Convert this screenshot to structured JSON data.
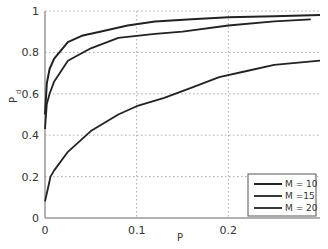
{
  "chart_data": {
    "type": "line",
    "title": "",
    "xlabel": "P",
    "ylabel": "P_d",
    "ylabel_main": "P",
    "ylabel_sub": "d",
    "xlim": [
      0,
      0.3
    ],
    "ylim": [
      0,
      1
    ],
    "grid": true,
    "legend_position": "lower right",
    "x_ticks": [
      "0",
      "0.1",
      "0.2"
    ],
    "y_ticks": [
      "0",
      "0.2",
      "0.4",
      "0.6",
      "0.8",
      "1"
    ],
    "series": [
      {
        "name": "M = 10",
        "x": [
          0,
          0.002,
          0.005,
          0.01,
          0.025,
          0.04,
          0.06,
          0.09,
          0.12,
          0.16,
          0.2,
          0.25,
          0.3
        ],
        "values": [
          0.5,
          0.65,
          0.72,
          0.77,
          0.85,
          0.88,
          0.9,
          0.93,
          0.95,
          0.96,
          0.97,
          0.975,
          0.98
        ]
      },
      {
        "name": "M =15",
        "x": [
          0,
          0.002,
          0.005,
          0.01,
          0.025,
          0.05,
          0.08,
          0.12,
          0.15,
          0.2,
          0.25,
          0.29
        ],
        "values": [
          0.43,
          0.55,
          0.6,
          0.66,
          0.76,
          0.82,
          0.87,
          0.89,
          0.9,
          0.93,
          0.95,
          0.96
        ]
      },
      {
        "name": "M = 20",
        "x": [
          0,
          0.003,
          0.006,
          0.01,
          0.025,
          0.05,
          0.08,
          0.1,
          0.13,
          0.16,
          0.19,
          0.22,
          0.25,
          0.3
        ],
        "values": [
          0.08,
          0.14,
          0.2,
          0.23,
          0.32,
          0.42,
          0.5,
          0.54,
          0.58,
          0.63,
          0.68,
          0.71,
          0.74,
          0.76
        ]
      }
    ]
  }
}
